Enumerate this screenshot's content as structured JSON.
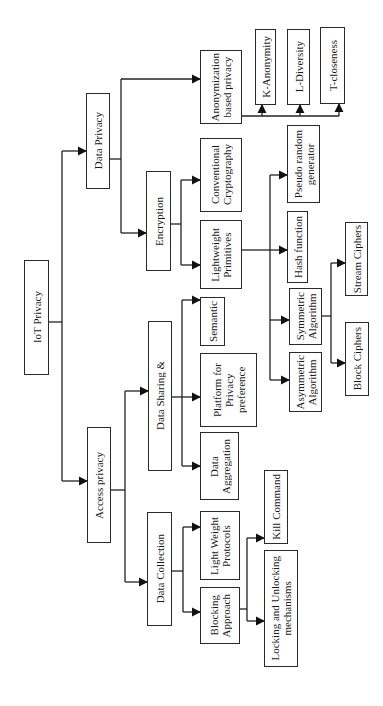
{
  "diagram": {
    "type": "hierarchy-tree",
    "orientation": "rotated-90-ccw",
    "root": "IoT Privacy",
    "nodes": {
      "iot_privacy": "IoT Privacy",
      "data_privacy": "Data Privacy",
      "access_privacy": "Access privacy",
      "anonymization": "Anonymization\nbased privacy",
      "k_anonymity": "K-Anonymity",
      "l_diversity": "L-Diversity",
      "t_closeness": "T-closeness",
      "encryption": "Encryption",
      "conventional_cryptography": "Conventional\nCryptography",
      "lightweight_primitives": "Lightweight\nPrimitives",
      "pseudo_random_generator": "Pseudo random\ngenerator",
      "hash_function": "Hash function",
      "symmetric_algorithm": "Symmetric\nAlgorithm",
      "asymmetric_algorithm": "Asymmetric\nAlgorithm",
      "stream_ciphers": "Stream Ciphers",
      "block_ciphers": "Block Ciphers",
      "data_sharing": "Data Sharing &",
      "semantic": "Semantic",
      "platform_privacy_preference": "Platform for\nPrivacy\npreference",
      "data_aggregation": "Data\nAggregation",
      "data_collection": "Data Collection",
      "light_weight_protocols": "Light Weight\nProtocols",
      "blocking_approach": "Blocking\nApproach",
      "kill_command": "Kill Command",
      "locking_unlocking": "Locking and Unlocking\nmechanisms"
    },
    "edges": [
      [
        "IoT Privacy",
        "Data Privacy"
      ],
      [
        "IoT Privacy",
        "Access privacy"
      ],
      [
        "Data Privacy",
        "Anonymization based privacy"
      ],
      [
        "Data Privacy",
        "Encryption"
      ],
      [
        "Anonymization based privacy",
        "K-Anonymity"
      ],
      [
        "Anonymization based privacy",
        "L-Diversity"
      ],
      [
        "Anonymization based privacy",
        "T-closeness"
      ],
      [
        "Encryption",
        "Conventional Cryptography"
      ],
      [
        "Encryption",
        "Lightweight Primitives"
      ],
      [
        "Lightweight Primitives",
        "Pseudo random generator"
      ],
      [
        "Lightweight Primitives",
        "Hash function"
      ],
      [
        "Lightweight Primitives",
        "Symmetric Algorithm"
      ],
      [
        "Lightweight Primitives",
        "Asymmetric Algorithm"
      ],
      [
        "Symmetric Algorithm",
        "Stream Ciphers"
      ],
      [
        "Symmetric Algorithm",
        "Block Ciphers"
      ],
      [
        "Access privacy",
        "Data Sharing &"
      ],
      [
        "Access privacy",
        "Data Collection"
      ],
      [
        "Data Sharing &",
        "Semantic"
      ],
      [
        "Data Sharing &",
        "Platform for Privacy preference"
      ],
      [
        "Data Sharing &",
        "Data Aggregation"
      ],
      [
        "Data Collection",
        "Light Weight Protocols"
      ],
      [
        "Data Collection",
        "Blocking Approach"
      ],
      [
        "Blocking Approach",
        "Kill Command"
      ],
      [
        "Blocking Approach",
        "Locking and Unlocking mechanisms"
      ]
    ]
  }
}
